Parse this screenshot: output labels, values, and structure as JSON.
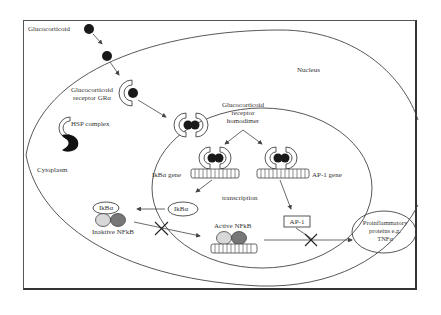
{
  "diagram": {
    "labels": {
      "glucocorticoid": "Glucocorticoid",
      "receptor_line1": "Glucocorticoid",
      "receptor_line2": "receptor GRα",
      "hsp_complex": "HSP complex",
      "cytoplasm": "Cytoplasm",
      "nucleus": "Nucleus",
      "homodimer_line1": "Glucocorticoid",
      "homodimer_line2": "receptor",
      "homodimer_line3": "homodimer",
      "ikba_gene": "IkBα gene",
      "ap1_gene": "AP-1 gene",
      "transcription": "transcription",
      "ikba_free": "IkBα",
      "ikba_bound": "IkBα",
      "inactive_nfkb": "Inaktive NFkB",
      "active_nfkb": "Active NFkB",
      "ap1_box": "AP-1",
      "proinflammatory_line1": "Proinflammatory",
      "proinflammatory_line2": "proteins e.g.",
      "proinflammatory_line3": "TNFα"
    },
    "colors": {
      "line": "#444444",
      "ligand": "#1a1a1a",
      "receptor_fill": "#ffffff",
      "nfkb_light": "#d8d8d8",
      "nfkb_dark": "#777777",
      "hsp": "#111111"
    }
  }
}
